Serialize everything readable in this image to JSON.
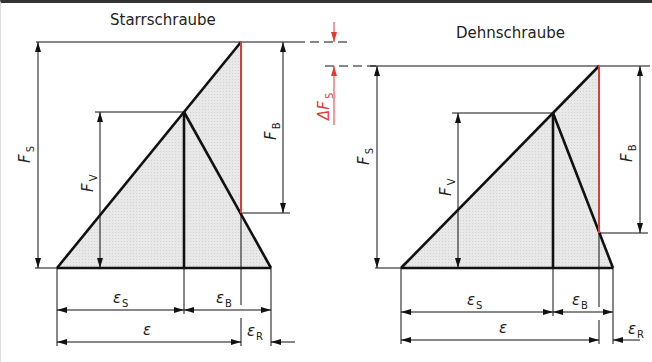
{
  "diagrams": {
    "left": {
      "title": "Starrschraube",
      "labels": {
        "FS": {
          "main": "F",
          "sub": "S"
        },
        "FV": {
          "main": "F",
          "sub": "V"
        },
        "FB": {
          "main": "F",
          "sub": "B"
        },
        "epsS": {
          "main": "ε",
          "sub": "S"
        },
        "epsB": {
          "main": "ε",
          "sub": "B"
        },
        "eps": {
          "main": "ε",
          "sub": ""
        },
        "epsR": {
          "main": "ε",
          "sub": "R"
        }
      }
    },
    "right": {
      "title": "Dehnschraube",
      "labels": {
        "FS": {
          "main": "F",
          "sub": "S"
        },
        "FV": {
          "main": "F",
          "sub": "V"
        },
        "FB": {
          "main": "F",
          "sub": "B"
        },
        "epsS": {
          "main": "ε",
          "sub": "S"
        },
        "epsB": {
          "main": "ε",
          "sub": "B"
        },
        "eps": {
          "main": "ε",
          "sub": ""
        },
        "epsR": {
          "main": "ε",
          "sub": "R"
        }
      }
    }
  },
  "delta": {
    "main": "ΔF",
    "sub": "S"
  },
  "colors": {
    "line": "#111111",
    "fill": "#e6e6e6",
    "accent_red": "#e53935"
  }
}
